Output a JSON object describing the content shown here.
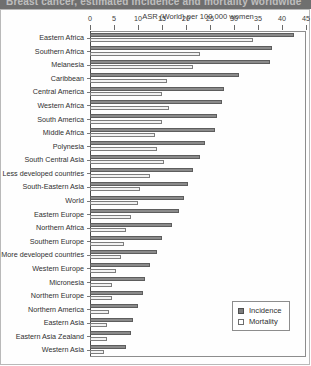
{
  "header": {
    "strip_text": "Breast cancer, estimated incidence and mortality worldwide"
  },
  "legend": {
    "incidence_label": "Incidence",
    "mortality_label": "Mortality",
    "position": "bottom-right"
  },
  "colors": {
    "incidence": "#8a8a8a",
    "mortality": "#f2f2f2",
    "axis": "#4a4a4a",
    "text": "#2f2f2f"
  },
  "chart_data": {
    "type": "bar",
    "orientation": "horizontal",
    "title": "",
    "xlabel": "ASR (World) per 100 000 women",
    "ylabel": "",
    "xlim": [
      0,
      45
    ],
    "xticks": [
      0,
      5,
      10,
      15,
      20,
      25,
      30,
      35,
      40,
      45
    ],
    "grid": false,
    "categories": [
      "Eastern Africa",
      "Southern Africa",
      "Melanesia",
      "Caribbean",
      "Central America",
      "Western Africa",
      "South America",
      "Middle Africa",
      "Polynesia",
      "South Central Asia",
      "Less developed countries",
      "South-Eastern Asia",
      "World",
      "Eastern Europe",
      "Northern Africa",
      "Southern Europe",
      "More developed countries",
      "Western Europe",
      "Micronesia",
      "Northern Europe",
      "Northern America",
      "Eastern Asia",
      "Eastern Asia Zealand",
      "Western Asia"
    ],
    "series": [
      {
        "name": "Incidence",
        "color": "#8a8a8a",
        "values": [
          42.5,
          38.0,
          37.5,
          31.0,
          28.0,
          27.5,
          26.5,
          26.0,
          24.0,
          23.0,
          21.5,
          20.5,
          19.5,
          18.5,
          17.0,
          15.0,
          14.0,
          12.5,
          11.5,
          11.0,
          10.0,
          9.0,
          8.5,
          7.5
        ]
      },
      {
        "name": "Mortality",
        "color": "#f2f2f2",
        "values": [
          34.0,
          23.0,
          21.5,
          16.0,
          15.0,
          16.5,
          15.0,
          13.5,
          14.0,
          15.5,
          12.5,
          10.5,
          10.0,
          8.5,
          7.5,
          7.0,
          6.5,
          5.5,
          4.5,
          4.5,
          4.0,
          3.5,
          3.5,
          3.0
        ]
      }
    ]
  }
}
